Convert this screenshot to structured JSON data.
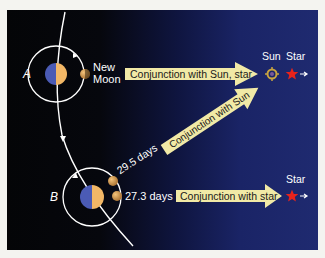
{
  "diagram": {
    "positions": [
      {
        "id": "A",
        "label": "A",
        "moon_label_line1": "New",
        "moon_label_line2": "Moon"
      },
      {
        "id": "B",
        "label": "B"
      }
    ],
    "arrows": [
      {
        "id": "sun-star",
        "label": "Conjunction with Sun, star"
      },
      {
        "id": "sun",
        "label": "Conjunction with Sun"
      },
      {
        "id": "star",
        "label": "Conjunction with star"
      }
    ],
    "periods": {
      "synodic": "29.5 days",
      "sidereal": "27.3 days"
    },
    "targets": {
      "top_sun": "Sun",
      "top_star": "Star",
      "bottom_star": "Star"
    },
    "colors": {
      "arrow_fill": "#f1e9a6",
      "earth_day": "#f2b766",
      "earth_night": "#4b5bb5",
      "moon": "#d9a050",
      "star": "#e8231b",
      "sun": "#c9a440",
      "orbit": "#ffffff"
    }
  }
}
